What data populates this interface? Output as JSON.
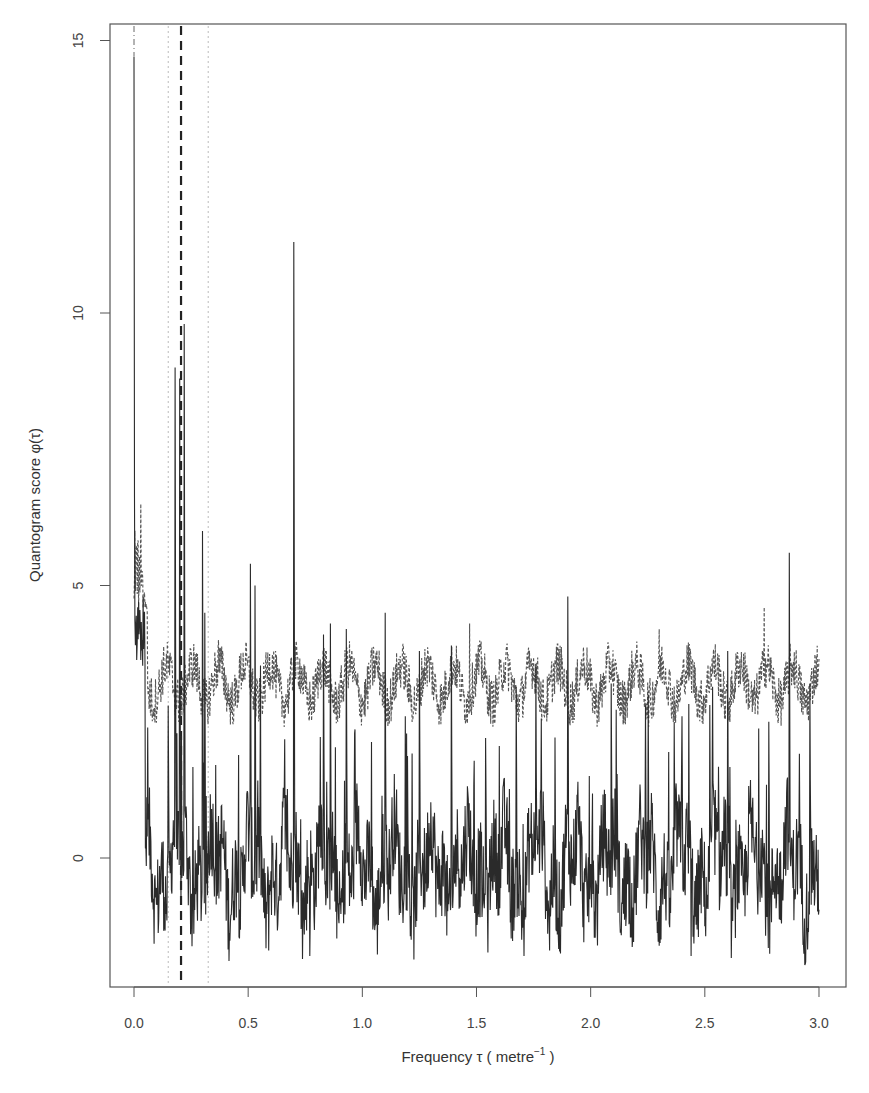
{
  "chart_data": {
    "type": "line",
    "title": "",
    "xlabel": "Frequency τ ( metre⁻¹ )",
    "xlabel_parts": {
      "main": "Frequency τ ( metre",
      "sup": "−1",
      "tail": " )"
    },
    "ylabel": "Quantogram score φ(τ)",
    "xlim": [
      -0.1,
      3.13
    ],
    "ylim": [
      -2.3,
      15.6
    ],
    "x_ticks": [
      0.0,
      0.5,
      1.0,
      1.5,
      2.0,
      2.5,
      3.0
    ],
    "x_tick_labels": [
      "0.0",
      "0.5",
      "1.0",
      "1.5",
      "2.0",
      "2.5",
      "3.0"
    ],
    "y_ticks": [
      0,
      5,
      10,
      15
    ],
    "y_tick_labels": [
      "0",
      "5",
      "10",
      "15"
    ],
    "grid": false,
    "legend": null,
    "series": [
      {
        "name": "Quantogram score",
        "style": "solid",
        "color": "#2a2a2a",
        "baseline_mean": -0.2,
        "baseline_range": [
          -1.8,
          2.0
        ],
        "peaks": [
          {
            "x": 0.0,
            "y": 14.7
          },
          {
            "x": 0.02,
            "y": 4.7
          },
          {
            "x": 0.04,
            "y": 4.8
          },
          {
            "x": 0.15,
            "y": 2.8
          },
          {
            "x": 0.18,
            "y": 9.0
          },
          {
            "x": 0.2,
            "y": 8.8
          },
          {
            "x": 0.22,
            "y": 9.8
          },
          {
            "x": 0.3,
            "y": 6.0
          },
          {
            "x": 0.31,
            "y": 4.5
          },
          {
            "x": 0.51,
            "y": 5.4
          },
          {
            "x": 0.53,
            "y": 5.0
          },
          {
            "x": 0.7,
            "y": 11.3
          },
          {
            "x": 0.83,
            "y": 4.1
          },
          {
            "x": 0.86,
            "y": 4.3
          },
          {
            "x": 0.93,
            "y": 4.2
          },
          {
            "x": 1.1,
            "y": 4.5
          },
          {
            "x": 1.25,
            "y": 3.8
          },
          {
            "x": 1.39,
            "y": 3.9
          },
          {
            "x": 1.54,
            "y": 2.2
          },
          {
            "x": 1.76,
            "y": 3.5
          },
          {
            "x": 1.9,
            "y": 4.8
          },
          {
            "x": 2.09,
            "y": 3.2
          },
          {
            "x": 2.24,
            "y": 2.8
          },
          {
            "x": 2.4,
            "y": 2.6
          },
          {
            "x": 2.6,
            "y": 3.8
          },
          {
            "x": 2.78,
            "y": 2.5
          },
          {
            "x": 2.87,
            "y": 5.6
          },
          {
            "x": 2.96,
            "y": 3.2
          }
        ],
        "troughs": [
          {
            "x": 0.59,
            "y": -1.7
          },
          {
            "x": 0.77,
            "y": -1.8
          },
          {
            "x": 1.82,
            "y": -1.7
          },
          {
            "x": 2.44,
            "y": -1.8
          }
        ]
      },
      {
        "name": "Reference envelope",
        "style": "dashed",
        "color": "#555555",
        "mean": 3.2,
        "range": [
          2.0,
          4.6
        ],
        "peaks": [
          {
            "x": 0.03,
            "y": 6.5
          },
          {
            "x": 0.37,
            "y": 4.0
          },
          {
            "x": 1.47,
            "y": 4.3
          },
          {
            "x": 2.3,
            "y": 4.2
          },
          {
            "x": 2.76,
            "y": 4.6
          }
        ]
      }
    ],
    "reference_lines": [
      {
        "x": 0.0,
        "style": "dotdash",
        "label": ""
      },
      {
        "x": 0.206,
        "style": "thick-dashed",
        "label": ""
      },
      {
        "x": 0.15,
        "style": "dotted",
        "label": ""
      },
      {
        "x": 0.325,
        "style": "dotted",
        "label": ""
      }
    ]
  }
}
